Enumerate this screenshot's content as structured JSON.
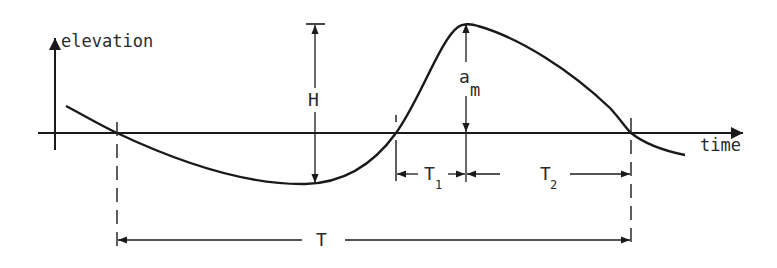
{
  "diagram": {
    "axes": {
      "y_label": "elevation",
      "x_label": "time"
    },
    "labels": {
      "wave_height": "H",
      "crest_amplitude_main": "a",
      "crest_amplitude_sub": "m",
      "period": "T",
      "rise_time_main": "T",
      "rise_time_sub": "1",
      "fall_time_main": "T",
      "fall_time_sub": "2"
    },
    "colors": {
      "ink": "#1a1a1a",
      "background": "#ffffff"
    }
  }
}
